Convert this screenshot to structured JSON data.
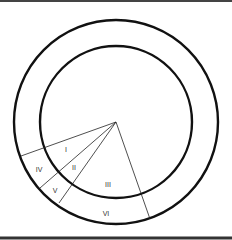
{
  "diagram": {
    "type": "concentric-circles-with-radial-sectors",
    "colors": {
      "background": "#ffffff",
      "stroke": "#111111",
      "thin_stroke": "#222222",
      "label": "#333333",
      "border": "#444444"
    },
    "center": {
      "x": 116,
      "y": 122
    },
    "outer_circle": {
      "r": 102
    },
    "inner_circle": {
      "r": 76
    },
    "radial_lines": [
      {
        "x2": 21,
        "y2": 156
      },
      {
        "x2": 40,
        "y2": 188
      },
      {
        "x2": 59,
        "y2": 203
      },
      {
        "x2": 150,
        "y2": 219
      }
    ],
    "labels": [
      {
        "text": "I",
        "x": 66,
        "y": 152
      },
      {
        "text": "II",
        "x": 74,
        "y": 170
      },
      {
        "text": "III",
        "x": 108,
        "y": 187
      },
      {
        "text": "IV",
        "x": 39,
        "y": 172
      },
      {
        "text": "V",
        "x": 55,
        "y": 193
      },
      {
        "text": "VI",
        "x": 106,
        "y": 216
      }
    ]
  }
}
